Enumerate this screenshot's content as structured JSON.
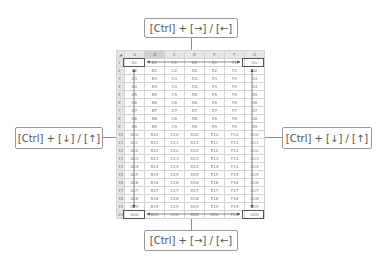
{
  "callouts": {
    "top": "[Ctrl] + [→] / [←]",
    "left": "[Ctrl] + [↓] / [↑]",
    "right": "[Ctrl] + [↓] / [↑]",
    "bottom": "[Ctrl] + [→] / [←]"
  },
  "sheet": {
    "corner": "◢",
    "columns": [
      "A",
      "B",
      "C",
      "D",
      "E",
      "F",
      "G"
    ],
    "rows": [
      [
        "1",
        "A1",
        "B1",
        "C1",
        "D1",
        "E1",
        "F1",
        "G1"
      ],
      [
        "2",
        "A2",
        "B2",
        "C2",
        "D2",
        "E2",
        "F2",
        "G2"
      ],
      [
        "3",
        "A3",
        "B3",
        "C3",
        "D3",
        "E3",
        "F3",
        "G3"
      ],
      [
        "4",
        "A4",
        "B4",
        "C4",
        "D4",
        "E4",
        "F4",
        "G4"
      ],
      [
        "5",
        "A5",
        "B5",
        "C5",
        "D5",
        "E5",
        "F5",
        "G5"
      ],
      [
        "6",
        "A6",
        "B6",
        "C6",
        "D6",
        "E6",
        "F6",
        "G6"
      ],
      [
        "7",
        "A7",
        "B7",
        "C7",
        "D7",
        "E7",
        "F7",
        "G7"
      ],
      [
        "8",
        "A8",
        "B8",
        "C8",
        "D8",
        "E8",
        "F8",
        "G8"
      ],
      [
        "9",
        "A9",
        "B9",
        "C9",
        "D9",
        "E9",
        "F9",
        "G9"
      ],
      [
        "10",
        "A10",
        "B10",
        "C10",
        "D10",
        "E10",
        "F10",
        "G10"
      ],
      [
        "11",
        "A11",
        "B11",
        "C11",
        "D11",
        "E11",
        "F11",
        "G11"
      ],
      [
        "12",
        "A12",
        "B12",
        "C12",
        "D12",
        "E12",
        "F12",
        "G12"
      ],
      [
        "13",
        "A13",
        "B13",
        "C13",
        "D13",
        "E13",
        "F13",
        "G13"
      ],
      [
        "14",
        "A14",
        "B14",
        "C14",
        "D14",
        "E14",
        "F14",
        "G14"
      ],
      [
        "15",
        "A15",
        "B15",
        "C15",
        "D15",
        "E15",
        "F15",
        "G15"
      ],
      [
        "16",
        "A16",
        "B16",
        "C16",
        "D16",
        "E16",
        "F16",
        "G16"
      ],
      [
        "17",
        "A17",
        "B17",
        "C17",
        "D17",
        "E17",
        "F17",
        "G17"
      ],
      [
        "18",
        "A18",
        "B18",
        "C18",
        "D18",
        "E18",
        "F18",
        "G18"
      ],
      [
        "19",
        "A19",
        "B19",
        "C19",
        "D19",
        "E19",
        "F19",
        "G19"
      ],
      [
        "20",
        "A20",
        "B20",
        "C20",
        "D20",
        "E20",
        "F20",
        "G20"
      ]
    ]
  },
  "highlighted_cells": [
    "A1",
    "G1",
    "A20",
    "G20"
  ],
  "colors": {
    "arrow": "#555555",
    "callout_border": "#9a9a9a",
    "header_bg": "#e6e6e6"
  }
}
